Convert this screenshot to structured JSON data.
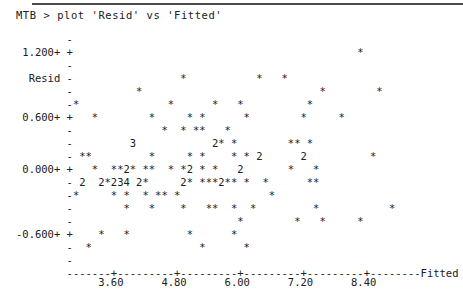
{
  "window": {
    "top_rule": true,
    "background_color": "#ffffff",
    "text_color": "#202020"
  },
  "command": {
    "prompt": "MTB >",
    "text": "MTB > plot 'Resid' vs 'Fitted'"
  },
  "chart_data": {
    "type": "scatter",
    "renderer": "minitab-character-plot",
    "title": "",
    "xlabel": "Fitted",
    "ylabel": "Resid",
    "xtick_labels": [
      "3.60",
      "4.80",
      "6.00",
      "7.20",
      "8.40"
    ],
    "xtick_values": [
      3.6,
      4.8,
      6.0,
      7.2,
      8.4
    ],
    "ytick_labels": [
      "1.200+",
      "0.600+",
      "0.000+",
      "-0.600+"
    ],
    "ytick_values": [
      1.2,
      0.6,
      0.0,
      -0.6
    ],
    "xlim": [
      3.0,
      9.1
    ],
    "ylim": [
      -0.95,
      1.42
    ],
    "grid": false,
    "legend": null,
    "point_glyph": "*",
    "overplot_digits": "A digit N in place of * means N points coincide at that cell",
    "x_axis_line": "-------+---------+---------+---------+---------+--------Fitted",
    "rows": [
      {
        "label": "",
        "tick": "-",
        "cells": ""
      },
      {
        "label": " 1.200+",
        "tick": "+",
        "cells": "                                             *"
      },
      {
        "label": "",
        "tick": "-",
        "cells": ""
      },
      {
        "label": "  Resid",
        "tick": "-",
        "cells": "                 *           *   *"
      },
      {
        "label": "",
        "tick": "-",
        "cells": "          *                            *        *"
      },
      {
        "label": "",
        "tick": "-",
        "cells": "*              *      *   *          *"
      },
      {
        "label": " 0.600+",
        "tick": "+",
        "cells": "   *        *     * *      *        *     *"
      },
      {
        "label": "",
        "tick": "-",
        "cells": "              *  * **   *"
      },
      {
        "label": "",
        "tick": "-",
        "cells": "         3            2* *        ** *"
      },
      {
        "label": "",
        "tick": "-",
        "cells": " **         *     * *    * * 2      2          *"
      },
      {
        "label": " 0.000+",
        "tick": "+",
        "cells": "   *  **2* **  * *2 * *   2       *   *"
      },
      {
        "label": "",
        "tick": "-",
        "cells": " 2  2*234 2*     2* ***2** *  *      **"
      },
      {
        "label": "",
        "tick": "-",
        "cells": "*     * *  * ** *              *"
      },
      {
        "label": "",
        "tick": "-",
        "cells": "        *   *    *   **  *  *         *           *"
      },
      {
        "label": "",
        "tick": "-",
        "cells": "                          *        *   *     *"
      },
      {
        "label": "-0.600+",
        "tick": "+",
        "cells": "    *   *         *      *"
      },
      {
        "label": "",
        "tick": "-",
        "cells": "  *                 *      *"
      },
      {
        "label": "",
        "tick": "-",
        "cells": ""
      }
    ]
  }
}
